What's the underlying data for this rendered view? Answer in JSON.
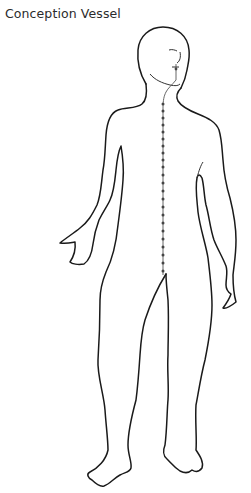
{
  "title": "Conception Vessel",
  "figure": {
    "meridian": "Conception Vessel",
    "meridian_color": "#444444",
    "outline_color": "#1a1a1a",
    "acupoint_count": 24
  }
}
